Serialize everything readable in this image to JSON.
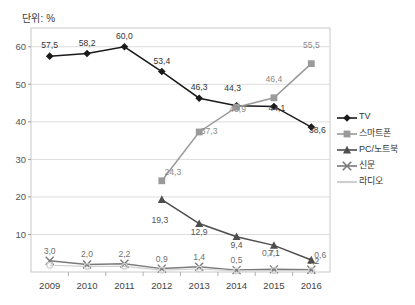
{
  "unit_label": "단위: %",
  "legend": {
    "position": "right",
    "items": [
      {
        "label": "TV",
        "marker": "diamond-marker-icon",
        "color": "#1a1a1a"
      },
      {
        "label": "스마트폰",
        "marker": "square-marker-icon",
        "color": "#9a9a9a"
      },
      {
        "label": "PC/노트북",
        "marker": "triangle-marker-icon",
        "color": "#4d4d4d"
      },
      {
        "label": "신문",
        "marker": "cross-marker-icon",
        "color": "#7a7a7a"
      },
      {
        "label": "라디오",
        "marker": "line-marker-icon",
        "color": "#cfcfcf"
      }
    ]
  },
  "axes": {
    "y_ticks": [
      "10",
      "20",
      "30",
      "40",
      "50",
      "60"
    ],
    "y_values": [
      10,
      20,
      30,
      40,
      50,
      60
    ],
    "ylim": [
      0,
      65
    ],
    "x_categories": [
      "2009",
      "2010",
      "2011",
      "2012",
      "2013",
      "2014",
      "2015",
      "2016"
    ]
  },
  "chart_data": {
    "type": "line",
    "title": "단위: %",
    "xlabel": "",
    "ylabel": "",
    "ylim": [
      0,
      65
    ],
    "grid": true,
    "legend_position": "right",
    "categories": [
      "2009",
      "2010",
      "2011",
      "2012",
      "2013",
      "2014",
      "2015",
      "2016"
    ],
    "series": [
      {
        "name": "TV",
        "color": "#1a1a1a",
        "marker": "diamond",
        "values": [
          57.5,
          58.2,
          60.0,
          53.4,
          46.3,
          44.3,
          44.1,
          38.6
        ],
        "labels": [
          "57,5",
          "58,2",
          "60,0",
          "53,4",
          "46,3",
          "44,3",
          "44,1",
          "38,6"
        ]
      },
      {
        "name": "스마트폰",
        "color": "#9a9a9a",
        "marker": "square",
        "values": [
          null,
          null,
          null,
          24.3,
          37.3,
          43.9,
          46.4,
          55.5
        ],
        "labels": [
          null,
          null,
          null,
          "24,3",
          "37,3",
          "43,9",
          "46,4",
          "55,5"
        ]
      },
      {
        "name": "PC/노트북",
        "color": "#4d4d4d",
        "marker": "triangle",
        "values": [
          null,
          null,
          null,
          19.3,
          12.9,
          9.4,
          7.1,
          3.2
        ],
        "labels": [
          null,
          null,
          null,
          "19,3",
          "12,9",
          "9,4",
          "7,1",
          "3,2"
        ]
      },
      {
        "name": "신문",
        "color": "#7a7a7a",
        "marker": "cross",
        "values": [
          3.0,
          2.0,
          2.2,
          0.9,
          1.4,
          0.5,
          0.7,
          0.6
        ],
        "labels": [
          "3,0",
          "2,0",
          "2,2",
          "0,9",
          "1,4",
          "0,5",
          "0,7",
          "0,6"
        ]
      },
      {
        "name": "라디오",
        "color": "#cfcfcf",
        "marker": "circle",
        "values": [
          1.8,
          1.5,
          1.5,
          0.5,
          0.8,
          0.3,
          0.4,
          0.4
        ],
        "labels": [
          null,
          null,
          null,
          null,
          null,
          null,
          null,
          null
        ]
      }
    ]
  }
}
